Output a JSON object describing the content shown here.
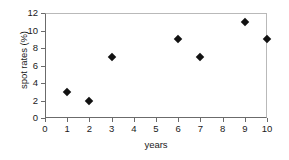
{
  "chart_data": {
    "type": "scatter",
    "title": "",
    "xlabel": "years",
    "ylabel": "spot rates (%)",
    "xlim": [
      0,
      10
    ],
    "ylim": [
      0,
      12
    ],
    "xticks": [
      0,
      1,
      2,
      3,
      4,
      5,
      6,
      7,
      8,
      9,
      10
    ],
    "yticks": [
      0,
      2,
      4,
      6,
      8,
      10,
      12
    ],
    "xtick_labels": [
      "0",
      "1",
      "2",
      "3",
      "4",
      "5",
      "6",
      "7",
      "8",
      "9",
      "10"
    ],
    "ytick_labels": [
      "0",
      "2",
      "4",
      "6",
      "8",
      "10",
      "12"
    ],
    "grid": false,
    "legend": null,
    "marker": "diamond",
    "marker_color": "#111111",
    "x": [
      1,
      2,
      3,
      6,
      7,
      9,
      10
    ],
    "values": [
      3,
      2,
      7,
      9,
      7,
      11,
      9
    ],
    "points": [
      {
        "x": 1,
        "y": 3
      },
      {
        "x": 2,
        "y": 2
      },
      {
        "x": 3,
        "y": 7
      },
      {
        "x": 6,
        "y": 9
      },
      {
        "x": 7,
        "y": 7
      },
      {
        "x": 9,
        "y": 11
      },
      {
        "x": 10,
        "y": 9
      }
    ]
  },
  "colors": {
    "marker": "#111111",
    "axis": "#6b6b6b",
    "frame": "#b9b9b9",
    "text": "#1a1a1a",
    "background": "#ffffff"
  }
}
